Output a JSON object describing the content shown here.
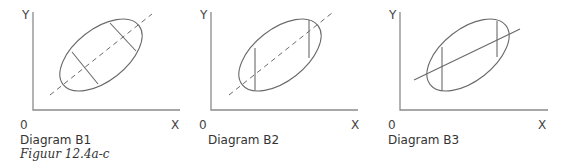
{
  "figure_caption": "Figuur 12.4a-c",
  "colors": {
    "line": "#6a6a6a",
    "axis": "#8a8a8a",
    "text": "#333333"
  },
  "diagrams": [
    {
      "title": "Diagram B1",
      "axis_labels": {
        "y": "Y",
        "x": "X",
        "origin": "0"
      },
      "regression_line": "dashed",
      "chords": "perpendicular to ellipse major axis"
    },
    {
      "title": "Diagram B2",
      "axis_labels": {
        "y": "Y",
        "x": "X",
        "origin": "0"
      },
      "regression_line": "dashed",
      "chords": "vertical"
    },
    {
      "title": "Diagram B3",
      "axis_labels": {
        "y": "Y",
        "x": "X",
        "origin": "0"
      },
      "regression_line": "solid, flatter slope",
      "chords": "vertical"
    }
  ]
}
